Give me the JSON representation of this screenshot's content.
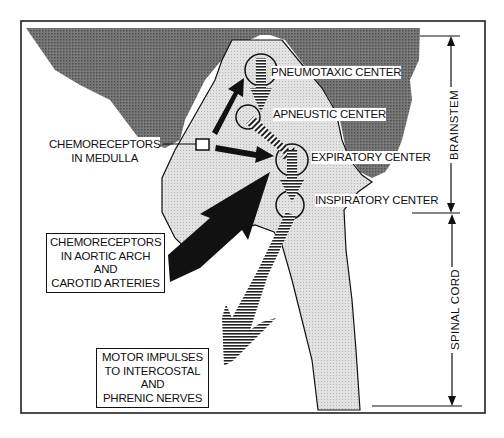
{
  "diagram": {
    "centers": [
      {
        "id": "pneumotaxic",
        "label": "PNEUMOTAXIC  CENTER"
      },
      {
        "id": "apneustic",
        "label": "APNEUSTIC CENTER"
      },
      {
        "id": "expiratory",
        "label": "EXPIRATORY CENTER"
      },
      {
        "id": "inspiratory",
        "label": "INSPIRATORY CENTER"
      }
    ],
    "chemoreceptors_medulla": {
      "lines": [
        "CHEMORECEPTORS",
        "IN MEDULLA"
      ]
    },
    "chemoreceptors_aortic": {
      "lines": [
        "CHEMORECEPTORS",
        "IN AORTIC ARCH",
        "AND",
        "CAROTID ARTERIES"
      ]
    },
    "motor_impulses": {
      "lines": [
        "MOTOR IMPULSES",
        "TO INTERCOSTAL",
        "AND",
        "PHRENIC NERVES"
      ]
    },
    "regions": {
      "brainstem": "BRAINSTEM",
      "spinal_cord": "SPINAL CORD"
    },
    "colors": {
      "dark_tissue": "#6e6e6e",
      "light_tissue": "#d9d9d9",
      "line": "#111111",
      "background": "#ffffff"
    }
  }
}
